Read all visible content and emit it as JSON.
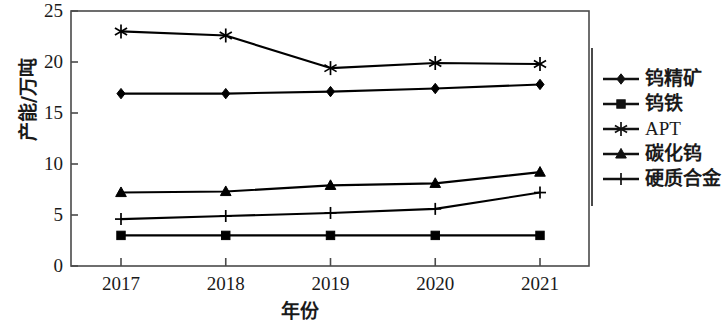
{
  "chart_data": {
    "type": "line",
    "title": "",
    "xlabel": "年份",
    "ylabel": "产能/万吨",
    "categories": [
      "2017",
      "2018",
      "2019",
      "2020",
      "2021"
    ],
    "x_tick_labels": [
      "2017",
      "2018",
      "2019",
      "2020",
      "2021"
    ],
    "y_tick_labels": [
      "0",
      "5",
      "10",
      "15",
      "20",
      "25"
    ],
    "y_ticks": [
      0,
      5,
      10,
      15,
      20,
      25
    ],
    "ylim": [
      0,
      25
    ],
    "grid": false,
    "legend_position": "right",
    "series": [
      {
        "name": "钨精矿",
        "marker": "diamond",
        "color": "#000000",
        "values": [
          16.9,
          16.9,
          17.1,
          17.4,
          17.8
        ]
      },
      {
        "name": "钨铁",
        "marker": "square",
        "color": "#000000",
        "values": [
          3.0,
          3.0,
          3.0,
          3.0,
          3.0
        ]
      },
      {
        "name": "APT",
        "marker": "asterisk",
        "color": "#000000",
        "values": [
          23.0,
          22.6,
          19.4,
          19.9,
          19.8
        ]
      },
      {
        "name": "碳化钨",
        "marker": "triangle",
        "color": "#000000",
        "values": [
          7.2,
          7.3,
          7.9,
          8.1,
          9.2
        ]
      },
      {
        "name": "硬质合金",
        "marker": "plus",
        "color": "#000000",
        "values": [
          4.6,
          4.9,
          5.2,
          5.6,
          7.2
        ]
      }
    ]
  },
  "axes": {
    "y_title": "产能/万吨",
    "x_title": "年份"
  },
  "legend": {
    "items": [
      {
        "label": "钨精矿",
        "marker": "diamond-marker"
      },
      {
        "label": "钨铁",
        "marker": "square-marker"
      },
      {
        "label": "APT",
        "marker": "asterisk-marker"
      },
      {
        "label": "碳化钨",
        "marker": "triangle-marker"
      },
      {
        "label": "硬质合金",
        "marker": "plus-marker"
      }
    ]
  },
  "style": {
    "line_color": "#111111",
    "axis_color": "#4a4a4a",
    "background": "#ffffff"
  }
}
